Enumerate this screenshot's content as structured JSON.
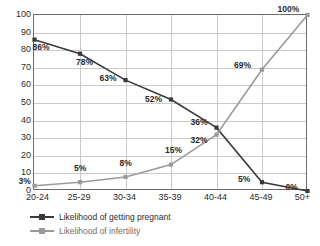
{
  "chart_data": {
    "type": "line",
    "title": "",
    "subtitle": "",
    "xlabel": "",
    "ylabel": "",
    "categories": [
      "20-24",
      "25-29",
      "30-34",
      "35-39",
      "40-44",
      "45-49",
      "50+"
    ],
    "ylim": [
      0,
      100
    ],
    "yticks": [
      0,
      10,
      20,
      30,
      40,
      50,
      60,
      70,
      80,
      90,
      100
    ],
    "grid": true,
    "legend_position": "bottom-left",
    "series": [
      {
        "name": "Likelihood of getting pregnant",
        "color": "#3a3a3a",
        "marker": "square",
        "values": [
          86,
          78,
          63,
          52,
          36,
          5,
          0
        ],
        "labels": [
          "86%",
          "78%",
          "63%",
          "52%",
          "36%",
          "5%",
          "0%"
        ]
      },
      {
        "name": "Likelihood of infertility",
        "color": "#9a9a9a",
        "marker": "square",
        "values": [
          3,
          5,
          8,
          15,
          32,
          69,
          100
        ],
        "labels": [
          "3%",
          "5%",
          "8%",
          "15%",
          "32%",
          "69%",
          "100%"
        ]
      }
    ]
  },
  "axis": {
    "y_ticks": [
      "100",
      "90",
      "80",
      "70",
      "60",
      "50",
      "40",
      "30",
      "20",
      "10",
      "0"
    ],
    "x_ticks": [
      "20-24",
      "25-29",
      "30-34",
      "35-39",
      "40-44",
      "45-49",
      "50+"
    ]
  },
  "legend": {
    "items": [
      {
        "label": "Likelihood of getting pregnant",
        "color": "#3a3a3a"
      },
      {
        "label": "Likelihood of infertility",
        "color": "#9a9a9a"
      }
    ]
  },
  "colors": {
    "pregnant_series": "#3a3a3a",
    "infertility_series": "#9a9a9a",
    "gridline": "#c9c9c9",
    "frame": "#6b6b6b",
    "text": "#2b2b2b"
  }
}
